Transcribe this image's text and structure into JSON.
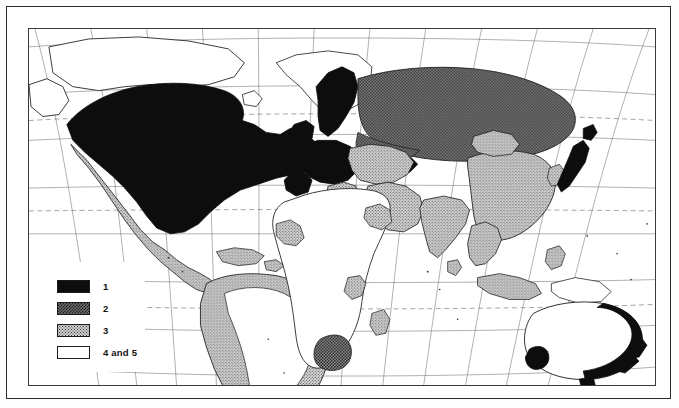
{
  "figure": {
    "kind": "world-choropleth-map",
    "projection": "pseudo-cylindrical (curved graticule)",
    "border_color": "#2b2b2b",
    "frame_color": "#3a3a3a"
  },
  "legend": {
    "name": "map-legend",
    "items": [
      {
        "id": "cat-1",
        "label": "1",
        "pattern": "solid-black",
        "color": "#0d0d0d"
      },
      {
        "id": "cat-2",
        "label": "2",
        "pattern": "checkerboard",
        "color": "#6d6d6d"
      },
      {
        "id": "cat-3",
        "label": "3",
        "pattern": "light-stipple",
        "color": "#cfcfcf"
      },
      {
        "id": "cat-4",
        "label": "4 and 5",
        "pattern": "white",
        "color": "#ffffff"
      }
    ]
  },
  "map": {
    "graticule": {
      "meridian_color": "#6a6a6a",
      "parallel_color": "#6a6a6a",
      "dashed_parallels": [
        "Arctic Circle",
        "Tropic of Cancer",
        "Tropic of Capricorn"
      ]
    },
    "regions": [
      {
        "name": "united-states-canada",
        "category": "1"
      },
      {
        "name": "mexico-central-america",
        "category": "3"
      },
      {
        "name": "caribbean",
        "category": "3"
      },
      {
        "name": "greenland",
        "category": "4 and 5"
      },
      {
        "name": "south-america-coastal",
        "category": "3"
      },
      {
        "name": "argentina-chile",
        "category": "2"
      },
      {
        "name": "brazil-interior",
        "category": "4 and 5"
      },
      {
        "name": "western-europe",
        "category": "1"
      },
      {
        "name": "scandinavia",
        "category": "1"
      },
      {
        "name": "eastern-europe",
        "category": "3"
      },
      {
        "name": "soviet-union",
        "category": "2"
      },
      {
        "name": "north-africa",
        "category": "4 and 5"
      },
      {
        "name": "sub-saharan-africa",
        "category": "4 and 5"
      },
      {
        "name": "south-africa",
        "category": "2"
      },
      {
        "name": "middle-east",
        "category": "3"
      },
      {
        "name": "india",
        "category": "3"
      },
      {
        "name": "china",
        "category": "3"
      },
      {
        "name": "japan",
        "category": "1"
      },
      {
        "name": "korea",
        "category": "3"
      },
      {
        "name": "southeast-asia",
        "category": "3"
      },
      {
        "name": "australia-coastal",
        "category": "1"
      },
      {
        "name": "australia-interior",
        "category": "4 and 5"
      },
      {
        "name": "new-zealand",
        "category": "1"
      }
    ]
  }
}
